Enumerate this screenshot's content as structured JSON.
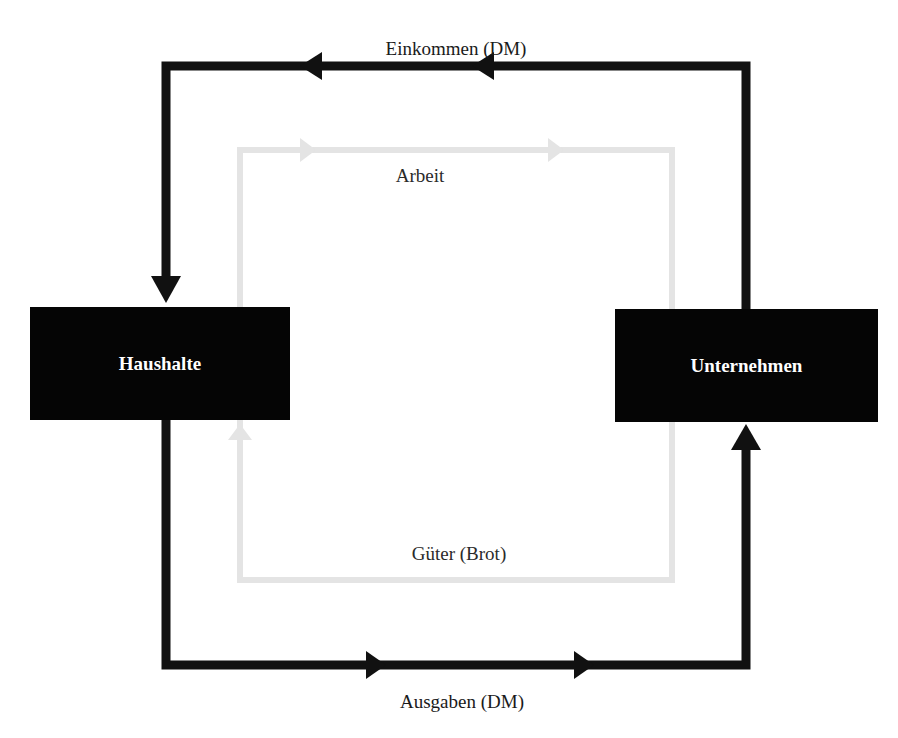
{
  "diagram": {
    "nodes": {
      "households": {
        "label": "Haushalte"
      },
      "firms": {
        "label": "Unternehmen"
      }
    },
    "flows": {
      "income": {
        "label": "Einkommen (DM)",
        "direction": "Unternehmen → Haushalte",
        "kind": "money"
      },
      "labor": {
        "label": "Arbeit",
        "direction": "Haushalte → Unternehmen",
        "kind": "real"
      },
      "goods": {
        "label": "Güter (Brot)",
        "direction": "Unternehmen → Haushalte",
        "kind": "real"
      },
      "spending": {
        "label": "Ausgaben (DM)",
        "direction": "Haushalte → Unternehmen",
        "kind": "money"
      }
    },
    "colors": {
      "money_flow": "#111111",
      "real_flow": "#e6e6e6",
      "box_fill": "#050505",
      "box_text": "#ffffff"
    }
  }
}
